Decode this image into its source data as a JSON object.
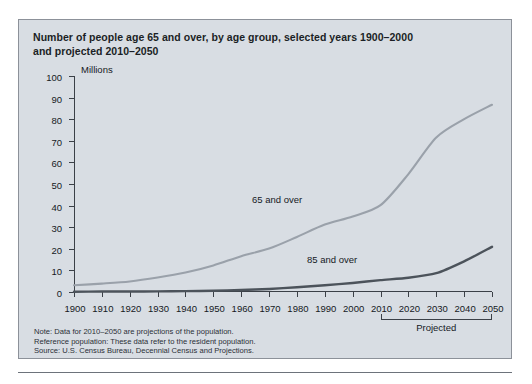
{
  "figure": {
    "title_line1": "Number of people age 65 and over, by age group, selected years 1900–2000",
    "title_line2": "and projected 2010–2050",
    "units_label": "Millions",
    "projected_label": "Projected",
    "notes": [
      "Note: Data for 2010–2050 are projections of the population.",
      "Reference population: These data refer to the resident population.",
      "Source: U.S. Census Bureau, Decennial Census and Projections."
    ],
    "colors": {
      "panel_background": "#d8dde3",
      "panel_border": "#8c9199",
      "axis": "#3b4047",
      "series_65_and_over": "#9aa1aa",
      "series_85_and_over": "#4c535b",
      "text": "#15191e"
    }
  },
  "chart_data": {
    "type": "line",
    "title": "Number of people age 65 and over, by age group, selected years 1900–2000 and projected 2010–2050",
    "xlabel": "",
    "ylabel": "Millions",
    "ylim": [
      0,
      100
    ],
    "xlim": [
      1900,
      2050
    ],
    "ytick_labels": [
      "0",
      "10",
      "20",
      "30",
      "40",
      "50",
      "60",
      "70",
      "80",
      "90",
      "100"
    ],
    "yticks": [
      0,
      10,
      20,
      30,
      40,
      50,
      60,
      70,
      80,
      90,
      100
    ],
    "x": [
      1900,
      1910,
      1920,
      1930,
      1940,
      1950,
      1960,
      1970,
      1980,
      1990,
      2000,
      2010,
      2020,
      2030,
      2040,
      2050
    ],
    "xtick_labels": [
      "1900",
      "1910",
      "1920",
      "1930",
      "1940",
      "1950",
      "1960",
      "1970",
      "1980",
      "1990",
      "2000",
      "2010",
      "2020",
      "2030",
      "2040",
      "2050"
    ],
    "grid": false,
    "legend_position": "inline-annotations",
    "annotations": [
      {
        "text": "65 and over",
        "x": 1975,
        "y": 38
      },
      {
        "text": "85 and over",
        "x": 2000,
        "y": 12
      },
      {
        "text": "Projected",
        "x": 2030,
        "y": -12
      }
    ],
    "projection_start_year": 2010,
    "series": [
      {
        "name": "65 and over",
        "color": "#9aa1aa",
        "values": [
          3.1,
          3.9,
          4.9,
          6.7,
          9.0,
          12.3,
          16.6,
          20.1,
          25.5,
          31.2,
          35.0,
          40.2,
          54.6,
          71.5,
          80.0,
          86.7
        ]
      },
      {
        "name": "85 and over",
        "color": "#4c535b",
        "values": [
          0.1,
          0.2,
          0.2,
          0.3,
          0.4,
          0.6,
          0.9,
          1.4,
          2.2,
          3.1,
          4.2,
          5.5,
          6.6,
          8.7,
          14.2,
          20.9
        ]
      }
    ]
  }
}
